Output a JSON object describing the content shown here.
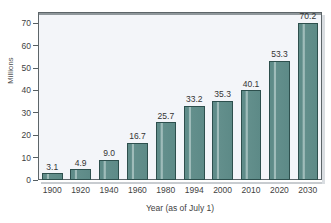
{
  "chart_data": {
    "type": "bar",
    "title": "",
    "xlabel": "Year (as of July 1)",
    "ylabel": "Millions",
    "categories": [
      "1900",
      "1920",
      "1940",
      "1960",
      "1980",
      "1994",
      "2000",
      "2010",
      "2020",
      "2030"
    ],
    "values": [
      3.1,
      4.9,
      9.0,
      16.7,
      25.7,
      33.2,
      35.3,
      40.1,
      53.3,
      70.2
    ],
    "value_labels": [
      "3.1",
      "4.9",
      "9.0",
      "16.7",
      "25.7",
      "33.2",
      "35.3",
      "40.1",
      "53.3",
      "70.2"
    ],
    "ylim": [
      0,
      75
    ],
    "yticks": [
      0,
      10,
      20,
      30,
      40,
      50,
      60,
      70
    ],
    "ytick_labels": [
      "0",
      "10",
      "20",
      "30",
      "40",
      "50",
      "60",
      "70"
    ],
    "grid": false,
    "legend": null,
    "bar_color": "#5d8a87",
    "bar_edge_color": "#2d4f4d",
    "plot_background": "#f3f5f9",
    "axis_color": "#5d6569"
  }
}
